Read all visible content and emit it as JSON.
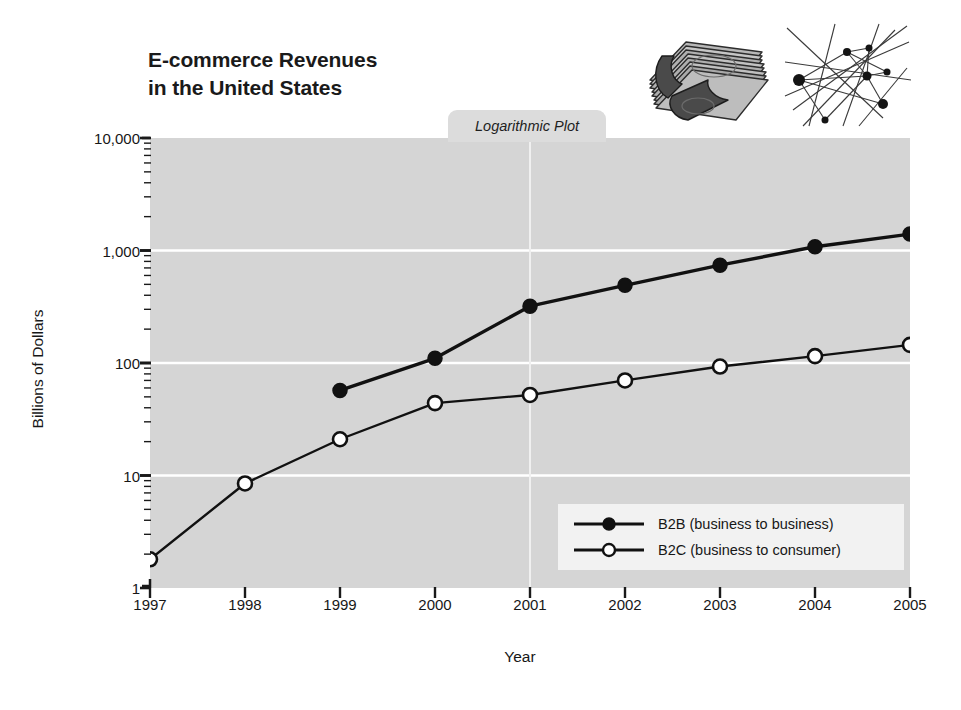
{
  "chart_data": {
    "type": "line",
    "title": "E-commerce Revenues\nin the United States",
    "subtitle": "Logarithmic Plot",
    "xlabel": "Year",
    "ylabel": "Billions of Dollars",
    "scale": "log",
    "grid": true,
    "legend_position": "inside bottom-right",
    "categories": [
      1997,
      1998,
      1999,
      2000,
      2001,
      2002,
      2003,
      2004,
      2005
    ],
    "xticklabels": [
      "1997",
      "1998",
      "1999",
      "2000",
      "2001",
      "2002",
      "2003",
      "2004",
      "2005"
    ],
    "yticklabels": [
      "1",
      "10",
      "100",
      "1,000",
      "10,000"
    ],
    "ytickvalues": [
      1,
      10,
      100,
      1000,
      10000
    ],
    "ylim": [
      1,
      10000
    ],
    "series": [
      {
        "name": "B2B (business to business)",
        "label": "B2B (business to business)",
        "marker": "filled-circle",
        "color": "#111111",
        "x": [
          1999,
          2000,
          2001,
          2002,
          2003,
          2004,
          2005
        ],
        "values": [
          57,
          110,
          320,
          490,
          740,
          1080,
          1400
        ]
      },
      {
        "name": "B2C (business to consumer)",
        "label": "B2C (business to consumer)",
        "marker": "open-circle",
        "color": "#111111",
        "x": [
          1997,
          1998,
          1999,
          2000,
          2001,
          2002,
          2003,
          2004,
          2005
        ],
        "values": [
          1.8,
          8.5,
          21,
          44,
          52,
          70,
          93,
          115,
          145
        ]
      }
    ]
  },
  "figure": {
    "background": "#ffffff",
    "plot_background": "#d5d5d5",
    "gridline_color": "#ffffff",
    "tab_background": "#dcdcdc",
    "legend_background": "#f2f2f2",
    "axis_color": "#1a1a1a"
  },
  "artwork": [
    {
      "name": "money-stack-illustration",
      "alt": "stack of banknotes"
    },
    {
      "name": "network-diagram-illustration",
      "alt": "network of connected nodes"
    }
  ]
}
